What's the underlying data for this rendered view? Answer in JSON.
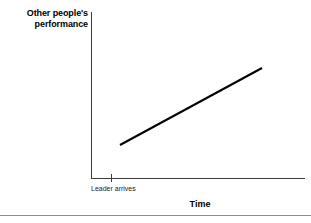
{
  "figure": {
    "name": "leadership-performance-line-chart"
  },
  "chart_data": {
    "type": "line",
    "title": "",
    "xlabel": "Time",
    "ylabel": "Other people's performance",
    "ylabel_lines": [
      "Other people's",
      "performance"
    ],
    "x_tick_labels": [
      "Leader arrives"
    ],
    "y_tick_labels": [],
    "grid": false,
    "legend": null,
    "axis_color": "#3c3c3c",
    "line_color": "#000000",
    "line_width_px": 2,
    "series": [
      {
        "name": "Other people's performance",
        "x": [
          "Leader arrives",
          "Later"
        ],
        "points_px": [
          [
            120,
            145
          ],
          [
            262,
            68
          ]
        ],
        "values": [
          0,
          1
        ],
        "description": "Straight upward-sloping line beginning just after the leader arrives and rising steadily over time"
      }
    ],
    "xlim_px": [
      91,
      305
    ],
    "ylim_px": [
      12,
      178
    ]
  },
  "footer": {
    "rule_color": "#8c8c8c"
  }
}
